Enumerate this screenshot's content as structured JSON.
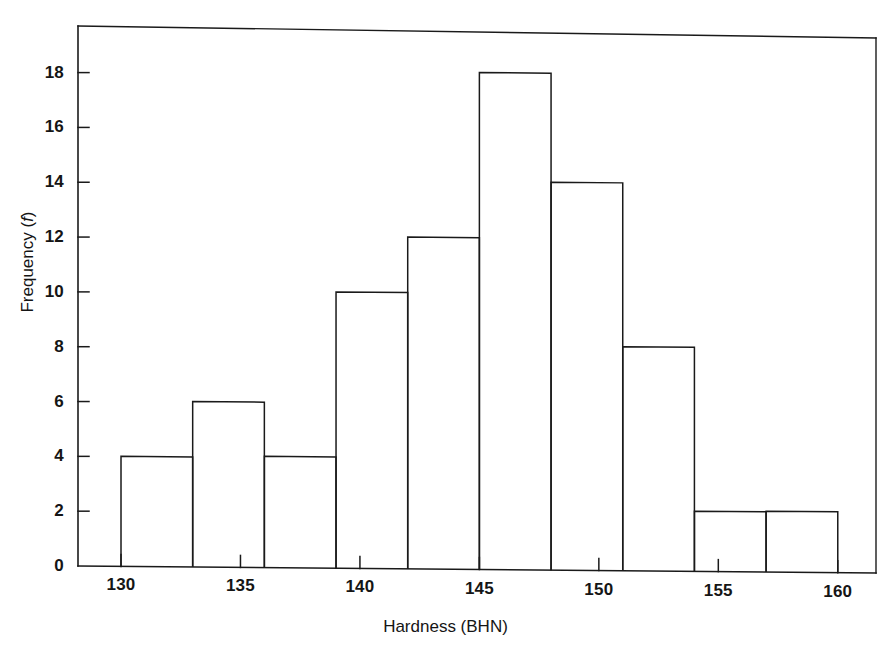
{
  "chart_data": {
    "type": "bar",
    "title": "",
    "subtitle": "",
    "xlabel": "Hardness (BHN)",
    "ylabel": "Frequency (f)",
    "ylabel_plain": "Frequency",
    "ylabel_symbol": "f",
    "xlabel_quantity": "Hardness",
    "xlabel_unit": "BHN",
    "bin_width": 3,
    "bin_edges": [
      130,
      133,
      136,
      139,
      142,
      145,
      148,
      151,
      154,
      157,
      160
    ],
    "categories": [
      "130-133",
      "133-136",
      "136-139",
      "139-142",
      "142-145",
      "145-148",
      "148-151",
      "151-154",
      "154-157",
      "157-160"
    ],
    "values": [
      4,
      6,
      4,
      10,
      12,
      18,
      14,
      8,
      2,
      2
    ],
    "bin_centers": [
      131.5,
      134.5,
      137.5,
      140.5,
      143.5,
      146.5,
      149.5,
      152.5,
      155.5,
      158.5
    ],
    "xticks": [
      130,
      135,
      140,
      145,
      150,
      155,
      160
    ],
    "xtick_labels": [
      "130",
      "135",
      "140",
      "145",
      "150",
      "155",
      "160"
    ],
    "yticks": [
      0,
      2,
      4,
      6,
      8,
      10,
      12,
      14,
      16,
      18
    ],
    "ytick_labels": [
      "0",
      "2",
      "4",
      "6",
      "8",
      "10",
      "12",
      "14",
      "16",
      "18"
    ],
    "xlim": [
      128.2,
      161.6
    ],
    "ylim": [
      0,
      19.7
    ],
    "grid": false,
    "legend": false,
    "legend_position": "none",
    "bar_fill": "#ffffff",
    "bar_stroke": "#1a1a1a",
    "axis_color": "#1a1a1a",
    "background": "#ffffff",
    "frame": "box",
    "annotations": []
  }
}
